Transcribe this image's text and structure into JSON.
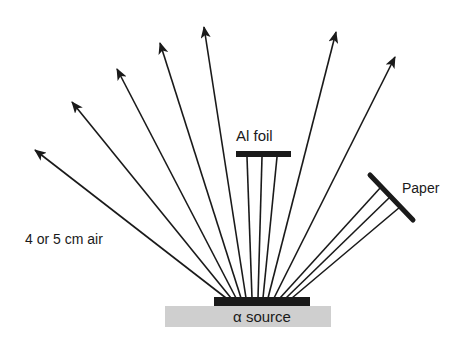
{
  "diagram": {
    "labels": {
      "air": "4 or 5 cm air",
      "foil": "Al foil",
      "paper": "Paper",
      "source": "α source"
    },
    "colors": {
      "ink": "#1a1a1a",
      "source_base": "#cfcfcf",
      "background": "#ffffff"
    },
    "source": {
      "emitter_bar": {
        "x": 214,
        "y": 297,
        "width": 96,
        "height": 9
      },
      "base": {
        "x": 165,
        "y": 306,
        "width": 166,
        "height": 21
      }
    },
    "air_rays": [
      {
        "from": [
          226,
          298
        ],
        "to": [
          35,
          150
        ]
      },
      {
        "from": [
          231,
          298
        ],
        "to": [
          72,
          102
        ]
      },
      {
        "from": [
          236,
          298
        ],
        "to": [
          117,
          69
        ]
      },
      {
        "from": [
          241,
          298
        ],
        "to": [
          160,
          43
        ]
      },
      {
        "from": [
          246,
          298
        ],
        "to": [
          204,
          27
        ]
      },
      {
        "from": [
          268,
          298
        ],
        "to": [
          336,
          32
        ]
      },
      {
        "from": [
          274,
          298
        ],
        "to": [
          395,
          57
        ]
      }
    ],
    "foil": {
      "bar": {
        "x": 236,
        "y": 151,
        "width": 55,
        "height": 6
      },
      "rays": [
        {
          "from": [
            252,
            298
          ],
          "to": [
            247,
            157
          ]
        },
        {
          "from": [
            258,
            298
          ],
          "to": [
            262,
            157
          ]
        },
        {
          "from": [
            263,
            298
          ],
          "to": [
            277,
            157
          ]
        }
      ]
    },
    "paper": {
      "bar": {
        "from": [
          370,
          175
        ],
        "to": [
          413,
          220
        ]
      },
      "rays": [
        {
          "from": [
            280,
            298
          ],
          "to": [
            381,
            187
          ]
        },
        {
          "from": [
            286,
            298
          ],
          "to": [
            390,
            197
          ]
        },
        {
          "from": [
            292,
            298
          ],
          "to": [
            400,
            207
          ]
        }
      ]
    }
  }
}
